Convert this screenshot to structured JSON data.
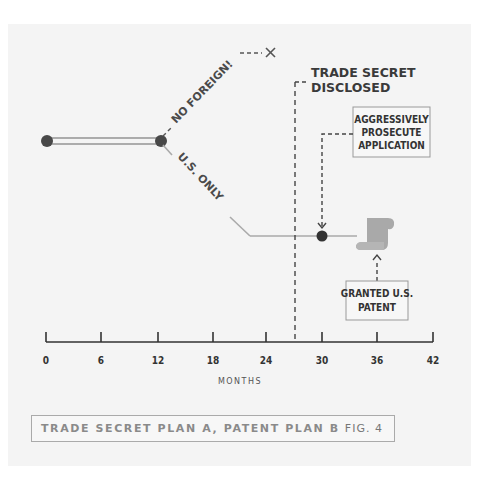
{
  "diagram": {
    "labels": {
      "no_foreign": "NO FOREIGN!",
      "us_only": "U.S. ONLY",
      "trade_secret_line1": "TRADE SECRET",
      "trade_secret_line2": "DISCLOSED",
      "prosecute_line1": "AGGRESSIVELY",
      "prosecute_line2": "PROSECUTE",
      "prosecute_line3": "APPLICATION",
      "granted_line1": "GRANTED U.S.",
      "granted_line2": "PATENT"
    },
    "axis": {
      "title": "MONTHS",
      "ticks": [
        "0",
        "6",
        "12",
        "18",
        "24",
        "30",
        "36",
        "42"
      ]
    },
    "events": [
      {
        "month": 0,
        "marker": "dot",
        "note": "start"
      },
      {
        "month": 12,
        "marker": "dot",
        "note": "branch point"
      },
      {
        "month": 22,
        "marker": "x",
        "note": "no foreign filing ends"
      },
      {
        "month": 27,
        "marker": "dashed-line",
        "note": "trade secret disclosed"
      },
      {
        "month": 30,
        "marker": "dot",
        "note": "aggressively prosecute application"
      },
      {
        "month": 36,
        "marker": "scroll",
        "note": "granted U.S. patent"
      }
    ],
    "colors": {
      "panel": "#f4f4f4",
      "line": "#aaaaaa",
      "dot": "#484848",
      "dashed": "#444444",
      "scroll": "#a9a9a9",
      "caption_text": "#8a8a8a"
    }
  },
  "caption": {
    "title": "TRADE SECRET PLAN A, PATENT PLAN B",
    "fig": "FIG. 4"
  }
}
